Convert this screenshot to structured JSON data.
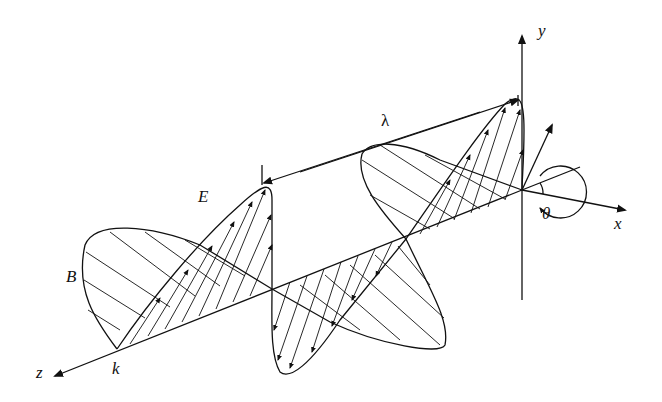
{
  "diagram": {
    "labels": {
      "y_axis": "y",
      "x_axis": "x",
      "z_axis": "z",
      "wavelength": "λ",
      "electric_field": "E",
      "magnetic_field": "B",
      "wave_vector": "k",
      "angle": "θ"
    },
    "colors": {
      "stroke": "#111111",
      "background": "#ffffff"
    }
  }
}
